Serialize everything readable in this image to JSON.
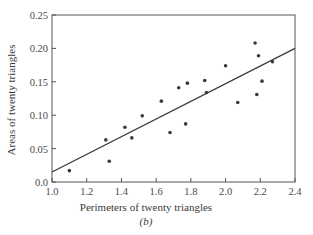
{
  "chart_data": {
    "type": "scatter",
    "title": "",
    "subtitle": "(b)",
    "xlabel": "Perimeters of twenty triangles",
    "ylabel": "Areas of twenty triangles",
    "xlim": [
      1.0,
      2.4
    ],
    "ylim": [
      0.0,
      0.25
    ],
    "xticks": [
      1.0,
      1.2,
      1.4,
      1.6,
      1.8,
      2.0,
      2.2,
      2.4
    ],
    "xtick_labels": [
      "1.0",
      "1.2",
      "1.4",
      "1.6",
      "1.8",
      "2.0",
      "2.2",
      "2.4"
    ],
    "yticks": [
      0.0,
      0.05,
      0.1,
      0.15,
      0.2,
      0.25
    ],
    "ytick_labels": [
      "0.0",
      "0.05",
      "0.10",
      "0.15",
      "0.20",
      "0.25"
    ],
    "grid": false,
    "legend": null,
    "series": [
      {
        "name": "triangles",
        "kind": "points",
        "x": [
          1.1,
          1.31,
          1.33,
          1.42,
          1.46,
          1.52,
          1.63,
          1.68,
          1.73,
          1.77,
          1.78,
          1.88,
          1.89,
          2.0,
          2.07,
          2.17,
          2.18,
          2.19,
          2.21,
          2.27
        ],
        "y": [
          0.017,
          0.063,
          0.031,
          0.082,
          0.066,
          0.099,
          0.121,
          0.074,
          0.141,
          0.087,
          0.148,
          0.152,
          0.134,
          0.174,
          0.119,
          0.208,
          0.131,
          0.189,
          0.151,
          0.18
        ]
      },
      {
        "name": "fitted line",
        "kind": "line",
        "x": [
          1.0,
          2.4
        ],
        "y": [
          0.015,
          0.2
        ]
      }
    ]
  },
  "colors": {
    "ink": "#3a3a3a",
    "axis": "#555555",
    "background": "#ffffff"
  }
}
